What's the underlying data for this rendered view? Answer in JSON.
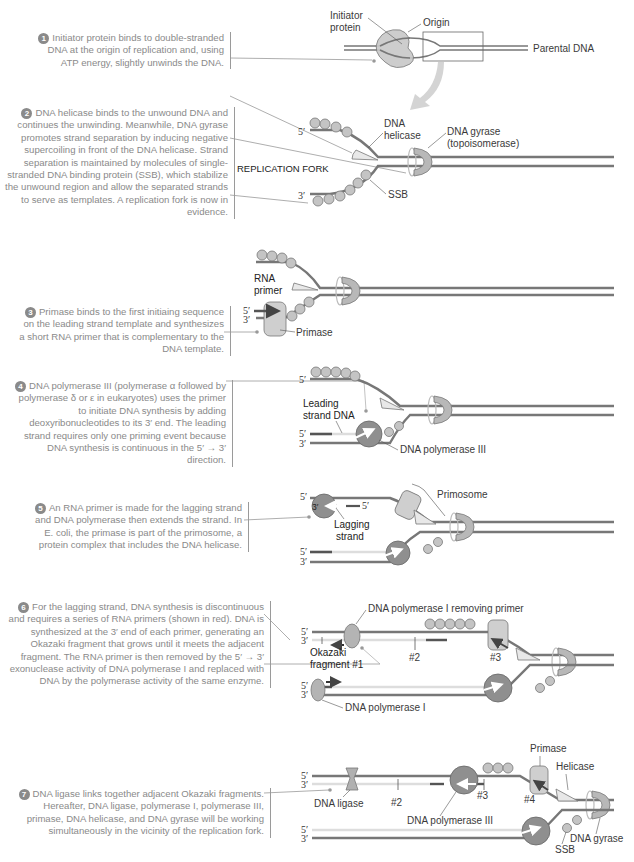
{
  "steps": [
    {
      "num": "1",
      "text": "Initiator protein binds to double-stranded DNA at the origin of replication and, using ATP energy, slightly unwinds the DNA."
    },
    {
      "num": "2",
      "text": "DNA helicase binds to the unwound DNA and continues the unwinding. Meanwhile, DNA gyrase promotes strand separation by inducing negative supercoiling in front of the DNA helicase. Strand separation is maintained by molecules of single-stranded DNA binding protein (SSB), which stabilize the unwound region and allow the separated strands to serve as templates. A replication fork is now in evidence."
    },
    {
      "num": "3",
      "text": "Primase binds to the first initiaing sequence on the leading strand template and synthesizes a short RNA primer that is complementary to the DNA template."
    },
    {
      "num": "4",
      "text": "DNA polymerase III (polymerase α followed by polymerase δ or ε in eukaryotes) uses the primer to initiate DNA synthesis by adding deoxyribonucleotides to its 3′ end. The leading strand requires only one priming event because DNA synthesis is continuous in the 5′ → 3′ direction."
    },
    {
      "num": "5",
      "text": "An RNA primer is made for the lagging strand and DNA polymerase then extends the strand. In E. coli, the primase is part of the primosome, a protein complex that includes the DNA helicase."
    },
    {
      "num": "6",
      "text": "For the lagging strand, DNA synthesis is discontinuous and requires a series of RNA primers (shown in red). DNA is synthesized at the 3′ end of each primer, generating an Okazaki fragment that grows until it meets the adjacent fragment. The RNA primer is then removed by the 5′ → 3′ exonuclease activity of DNA polymerase I and replaced with DNA by the polymerase activity of the same enzyme."
    },
    {
      "num": "7",
      "text": "DNA ligase links together adjacent Okazaki fragments. Hereafter, DNA ligase, polymerase I, polymerase III, primase, DNA helicase, and DNA gyrase will be working simultaneously in the vicinity of the replication fork."
    }
  ],
  "labels": {
    "initiator_line1": "Initiator",
    "initiator_line2": "protein",
    "origin": "Origin",
    "parental_dna": "Parental DNA",
    "dna_helicase_1": "DNA",
    "dna_helicase_2": "helicase",
    "dna_gyrase_1": "DNA gyrase",
    "dna_gyrase_2": "(topoisomerase)",
    "replication_fork": "REPLICATION FORK",
    "ssb": "SSB",
    "rna_primer_1": "RNA",
    "rna_primer_2": "primer",
    "primase": "Primase",
    "leading_1": "Leading",
    "leading_2": "strand DNA",
    "dna_pol_iii": "DNA polymerase III",
    "primosome": "Primosome",
    "lagging_1": "Lagging",
    "lagging_2": "strand",
    "pol_i_removing": "DNA polymerase I removing primer",
    "okazaki_1": "Okazaki",
    "okazaki_2": "fragment #1",
    "frag2": "#2",
    "frag3": "#3",
    "frag4": "#4",
    "dna_pol_i": "DNA polymerase I",
    "dna_ligase": "DNA ligase",
    "helicase": "Helicase",
    "dna_gyrase": "DNA gyrase",
    "five_prime": "5′",
    "three_prime": "3′"
  },
  "colors": {
    "strand": "#7a7a7a",
    "new_strand": "#dcdcdc",
    "primer": "#555555",
    "protein": "#c8c8c8",
    "polymerase": "#8f8f8f",
    "text": "#8a8a8a"
  }
}
